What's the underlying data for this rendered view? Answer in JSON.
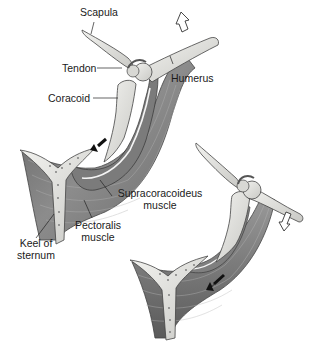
{
  "figure": {
    "colors": {
      "bone": "#e6e6e2",
      "bone_outline": "#5a5a5a",
      "muscle_dark": "#6f6f6f",
      "muscle_mid": "#9a9a9a",
      "muscle_light": "#c4c4c4",
      "arrow_black": "#111111",
      "arrow_outline": "#333333"
    }
  },
  "labels": {
    "scapula": "Scapula",
    "tendon": "Tendon",
    "coracoid": "Coracoid",
    "humerus": "Humerus",
    "supracoracoideus_line1": "Supracoracoideus",
    "supracoracoideus_line2": "muscle",
    "pectoralis_line1": "Pectoralis",
    "pectoralis_line2": "muscle",
    "keel_line1": "Keel of",
    "keel_line2": "sternum"
  },
  "panels": [
    {
      "name": "upstroke",
      "wing_motion": "up",
      "arrow_style": "outline"
    },
    {
      "name": "downstroke",
      "wing_motion": "down",
      "arrow_style": "outline"
    }
  ]
}
